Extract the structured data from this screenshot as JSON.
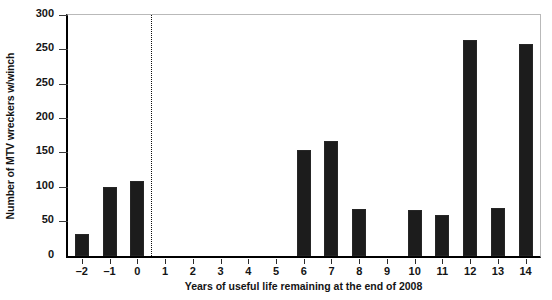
{
  "chart_data": {
    "type": "bar",
    "title": "",
    "xlabel": "Years of useful life remaining at the end of 2008",
    "ylabel": "Number of MTV wreckers w/winch",
    "categories": [
      "-2",
      "-1",
      "0",
      "1",
      "2",
      "3",
      "4",
      "5",
      "6",
      "7",
      "8",
      "9",
      "10",
      "11",
      "12",
      "13",
      "14"
    ],
    "values": [
      28,
      86,
      94,
      0,
      0,
      0,
      0,
      0,
      132,
      143,
      59,
      0,
      58,
      51,
      269,
      60,
      265
    ],
    "ylim": [
      0,
      300
    ],
    "ytick_labels": [
      "300",
      "250",
      "250",
      "200",
      "150",
      "100",
      "50",
      "0"
    ],
    "ytick_values": [
      300,
      275,
      250,
      200,
      150,
      100,
      50,
      0
    ],
    "grid": false,
    "legend": null,
    "bar_color": "#1c1c1c",
    "annotations": [
      {
        "name": "vertical-divider",
        "style": "dotted",
        "position_between": [
          "0",
          "1"
        ],
        "color": "#0d0d0d"
      }
    ]
  }
}
